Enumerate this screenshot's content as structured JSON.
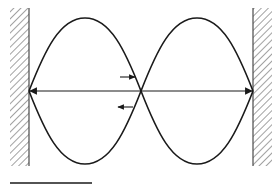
{
  "diagram": {
    "title": "Standing wave on a string fixed between two walls (two loops)",
    "colors": {
      "stroke": "#1a1a1a",
      "hatch": "#6e6e6e",
      "background": "#ffffff"
    },
    "walls": [
      {
        "side": "left",
        "x": 10,
        "y": 8,
        "width": 19,
        "height": 158,
        "edge_x": 29
      },
      {
        "side": "right",
        "x": 253,
        "y": 8,
        "width": 19,
        "height": 158,
        "edge_x": 253
      }
    ],
    "axis_line": {
      "x1": 29,
      "x2": 253,
      "y": 91,
      "double_headed": true
    },
    "loops": [
      {
        "from_x": 29,
        "to_x": 141,
        "top_y": 18,
        "bottom_y": 164
      },
      {
        "from_x": 141,
        "to_x": 253,
        "top_y": 18,
        "bottom_y": 164
      }
    ],
    "node_x": 141,
    "direction_arrows": [
      {
        "direction": "right",
        "x1": 120,
        "x2": 135,
        "y": 77
      },
      {
        "direction": "left",
        "x1": 133,
        "x2": 118,
        "y": 107
      }
    ],
    "scale_bar": {
      "x1": 10,
      "x2": 92,
      "y": 183
    }
  }
}
